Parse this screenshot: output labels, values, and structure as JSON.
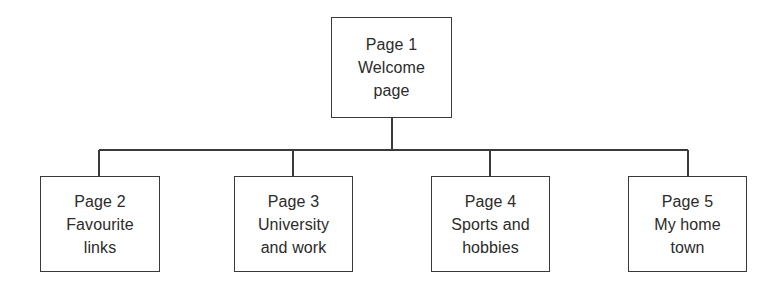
{
  "diagram": {
    "background_color": "#ffffff",
    "line_color": "#3a3a3a",
    "text_color": "#2b2b2b",
    "root": {
      "id": "page-1",
      "lines": [
        "Page 1",
        "Welcome",
        "page"
      ],
      "line_1": "Page 1",
      "line_2": "Welcome",
      "line_3": "page"
    },
    "children": [
      {
        "id": "page-2",
        "lines": [
          "Page 2",
          "Favourite",
          "links"
        ],
        "line_1": "Page 2",
        "line_2": "Favourite",
        "line_3": "links"
      },
      {
        "id": "page-3",
        "lines": [
          "Page 3",
          "University",
          "and work"
        ],
        "line_1": "Page 3",
        "line_2": "University",
        "line_3": "and work"
      },
      {
        "id": "page-4",
        "lines": [
          "Page 4",
          "Sports and",
          "hobbies"
        ],
        "line_1": "Page 4",
        "line_2": "Sports and",
        "line_3": "hobbies"
      },
      {
        "id": "page-5",
        "lines": [
          "Page 5",
          "My home",
          "town"
        ],
        "line_1": "Page 5",
        "line_2": "My home",
        "line_3": "town"
      }
    ]
  }
}
